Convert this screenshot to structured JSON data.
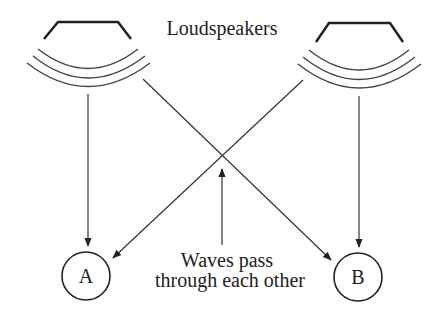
{
  "diagram": {
    "title": "Loudspeakers",
    "annotation": {
      "line1": "Waves pass",
      "line2": "through each other"
    },
    "listeners": [
      {
        "label": "A"
      },
      {
        "label": "B"
      }
    ],
    "colors": {
      "stroke": "#222222",
      "wave": "#444444",
      "background": "#ffffff"
    }
  }
}
